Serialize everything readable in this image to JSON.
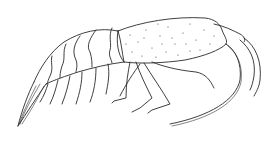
{
  "figure": {
    "alt": "Lateral view line illustration of a shrimp with stippled carapace, segmented abdomen, walking legs and long antennae",
    "colors": {
      "background": "#ffffff",
      "ink": "#2a2a2a"
    }
  }
}
